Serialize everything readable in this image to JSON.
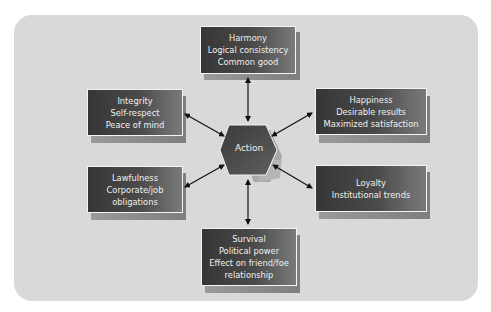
{
  "diagram": {
    "center": {
      "label": "Action",
      "shape": "hexagon"
    },
    "nodes": [
      {
        "id": "harmony",
        "position": "top",
        "lines": [
          "Harmony",
          "Logical consistency",
          "Common good"
        ]
      },
      {
        "id": "integrity",
        "position": "upper-left",
        "lines": [
          "Integrity",
          "Self-respect",
          "Peace of mind"
        ]
      },
      {
        "id": "happiness",
        "position": "upper-right",
        "lines": [
          "Happiness",
          "Desirable results",
          "Maximized satisfaction"
        ]
      },
      {
        "id": "lawfulness",
        "position": "lower-left",
        "lines": [
          "Lawfulness",
          "Corporate/job",
          "obligations"
        ]
      },
      {
        "id": "loyalty",
        "position": "lower-right",
        "lines": [
          "Loyalty",
          "Institutional trends"
        ]
      },
      {
        "id": "survival",
        "position": "bottom",
        "lines": [
          "Survival",
          "Political power",
          "Effect on friend/foe",
          "relationship"
        ]
      }
    ],
    "edges": [
      {
        "from": "action",
        "to": "harmony",
        "type": "bidirectional"
      },
      {
        "from": "action",
        "to": "integrity",
        "type": "bidirectional"
      },
      {
        "from": "action",
        "to": "happiness",
        "type": "bidirectional"
      },
      {
        "from": "action",
        "to": "lawfulness",
        "type": "bidirectional"
      },
      {
        "from": "action",
        "to": "loyalty",
        "type": "bidirectional"
      },
      {
        "from": "action",
        "to": "survival",
        "type": "bidirectional"
      }
    ],
    "colors": {
      "panel": "#d9d9d9",
      "box_dark": "#363636",
      "box_light": "#7a7a7a",
      "text": "#f0f0f0",
      "arrow": "#111111"
    }
  }
}
